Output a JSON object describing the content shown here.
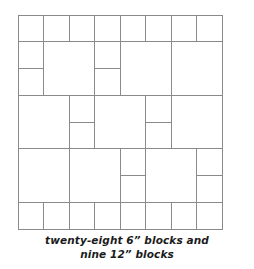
{
  "diagram": {
    "unit_inches": 6,
    "grid_units_wide": 8,
    "grid_units_tall": 8,
    "line_color": "#8a8a8a",
    "background_color": "#ffffff",
    "origin_x": 18,
    "origin_y": 15,
    "unit_px_x": 25.5,
    "unit_px_y": 26.75,
    "blocks": [
      {
        "name": "block-r1c1-6in",
        "size": 6,
        "col": 0,
        "row": 0,
        "w": 1,
        "h": 1
      },
      {
        "name": "block-r1c2-6in",
        "size": 6,
        "col": 1,
        "row": 0,
        "w": 1,
        "h": 1
      },
      {
        "name": "block-r1c3-6in",
        "size": 6,
        "col": 2,
        "row": 0,
        "w": 1,
        "h": 1
      },
      {
        "name": "block-r1c4-6in",
        "size": 6,
        "col": 3,
        "row": 0,
        "w": 1,
        "h": 1
      },
      {
        "name": "block-r1c5-6in",
        "size": 6,
        "col": 4,
        "row": 0,
        "w": 1,
        "h": 1
      },
      {
        "name": "block-r1c6-6in",
        "size": 6,
        "col": 5,
        "row": 0,
        "w": 1,
        "h": 1
      },
      {
        "name": "block-r1c7-6in",
        "size": 6,
        "col": 6,
        "row": 0,
        "w": 1,
        "h": 1
      },
      {
        "name": "block-r1c8-6in",
        "size": 6,
        "col": 7,
        "row": 0,
        "w": 1,
        "h": 1
      },
      {
        "name": "block-r2c1-6in",
        "size": 6,
        "col": 0,
        "row": 1,
        "w": 1,
        "h": 1
      },
      {
        "name": "block-r3c1-6in",
        "size": 6,
        "col": 0,
        "row": 2,
        "w": 1,
        "h": 1
      },
      {
        "name": "block-r2c2-12in",
        "size": 12,
        "col": 1,
        "row": 1,
        "w": 2,
        "h": 2
      },
      {
        "name": "block-r2c4-6in",
        "size": 6,
        "col": 3,
        "row": 1,
        "w": 1,
        "h": 1
      },
      {
        "name": "block-r3c4-6in",
        "size": 6,
        "col": 3,
        "row": 2,
        "w": 1,
        "h": 1
      },
      {
        "name": "block-r2c5-12in",
        "size": 12,
        "col": 4,
        "row": 1,
        "w": 2,
        "h": 2
      },
      {
        "name": "block-r2c7-12in",
        "size": 12,
        "col": 6,
        "row": 1,
        "w": 2,
        "h": 2
      },
      {
        "name": "block-r4c1-12in",
        "size": 12,
        "col": 0,
        "row": 3,
        "w": 2,
        "h": 2
      },
      {
        "name": "block-r4c3-6in",
        "size": 6,
        "col": 2,
        "row": 3,
        "w": 1,
        "h": 1
      },
      {
        "name": "block-r5c3-6in",
        "size": 6,
        "col": 2,
        "row": 4,
        "w": 1,
        "h": 1
      },
      {
        "name": "block-r4c4-12in",
        "size": 12,
        "col": 3,
        "row": 3,
        "w": 2,
        "h": 2
      },
      {
        "name": "block-r4c6-6in",
        "size": 6,
        "col": 5,
        "row": 3,
        "w": 1,
        "h": 1
      },
      {
        "name": "block-r5c6-6in",
        "size": 6,
        "col": 5,
        "row": 4,
        "w": 1,
        "h": 1
      },
      {
        "name": "block-r4c7-12in",
        "size": 12,
        "col": 6,
        "row": 3,
        "w": 2,
        "h": 2
      },
      {
        "name": "block-r6c1-12in",
        "size": 12,
        "col": 0,
        "row": 5,
        "w": 2,
        "h": 2
      },
      {
        "name": "block-r6c3-12in",
        "size": 12,
        "col": 2,
        "row": 5,
        "w": 2,
        "h": 2
      },
      {
        "name": "block-r6c5-6in",
        "size": 6,
        "col": 4,
        "row": 5,
        "w": 1,
        "h": 1
      },
      {
        "name": "block-r7c5-6in",
        "size": 6,
        "col": 4,
        "row": 6,
        "w": 1,
        "h": 1
      },
      {
        "name": "block-r6c6-12in",
        "size": 12,
        "col": 5,
        "row": 5,
        "w": 2,
        "h": 2
      },
      {
        "name": "block-r6c8-6in",
        "size": 6,
        "col": 7,
        "row": 5,
        "w": 1,
        "h": 1
      },
      {
        "name": "block-r7c8-6in",
        "size": 6,
        "col": 7,
        "row": 6,
        "w": 1,
        "h": 1
      },
      {
        "name": "block-r8c1-6in",
        "size": 6,
        "col": 0,
        "row": 7,
        "w": 1,
        "h": 1
      },
      {
        "name": "block-r8c2-6in",
        "size": 6,
        "col": 1,
        "row": 7,
        "w": 1,
        "h": 1
      },
      {
        "name": "block-r8c3-6in",
        "size": 6,
        "col": 2,
        "row": 7,
        "w": 1,
        "h": 1
      },
      {
        "name": "block-r8c4-6in",
        "size": 6,
        "col": 3,
        "row": 7,
        "w": 1,
        "h": 1
      },
      {
        "name": "block-r8c5-6in",
        "size": 6,
        "col": 4,
        "row": 7,
        "w": 1,
        "h": 1
      },
      {
        "name": "block-r8c6-6in",
        "size": 6,
        "col": 5,
        "row": 7,
        "w": 1,
        "h": 1
      },
      {
        "name": "block-r8c7-6in",
        "size": 6,
        "col": 6,
        "row": 7,
        "w": 1,
        "h": 1
      },
      {
        "name": "block-r8c8-6in",
        "size": 6,
        "col": 7,
        "row": 7,
        "w": 1,
        "h": 1
      }
    ]
  },
  "caption": {
    "line1": "twenty-eight 6” blocks and",
    "line2": "nine 12” blocks",
    "full_text": "twenty-eight 6” blocks and nine 12” blocks",
    "small_block_count": "twenty-eight",
    "small_block_size": "6”",
    "large_block_count": "nine",
    "large_block_size": "12”"
  }
}
